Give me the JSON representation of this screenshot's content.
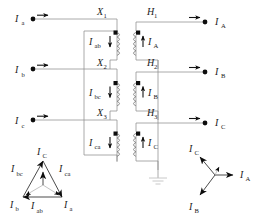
{
  "figure": {
    "type": "electrical-schematic"
  },
  "colors": {
    "wire": "#5a5a5a",
    "wire_light": "#8d8d8d",
    "text": "#1a1a1a",
    "arrow": "#0d0d0d",
    "ground": "#c2c2c2",
    "background": "#ffffff"
  },
  "left_terminals": [
    {
      "base": "I",
      "sub": "a",
      "id": "terminal-ia"
    },
    {
      "base": "I",
      "sub": "b",
      "id": "terminal-ib"
    },
    {
      "base": "I",
      "sub": "c",
      "id": "terminal-ic"
    }
  ],
  "right_terminals": [
    {
      "base": "I",
      "sub": "A",
      "id": "terminal-IA"
    },
    {
      "base": "I",
      "sub": "B",
      "id": "terminal-IB"
    },
    {
      "base": "I",
      "sub": "C",
      "id": "terminal-IC"
    }
  ],
  "delta_windings": [
    {
      "tap": "X",
      "tap_sub": "1",
      "current": "I",
      "current_sub": "ab"
    },
    {
      "tap": "X",
      "tap_sub": "2",
      "current": "I",
      "current_sub": "bc"
    },
    {
      "tap": "X",
      "tap_sub": "3",
      "current": "I",
      "current_sub": "ca"
    }
  ],
  "wye_windings": [
    {
      "tap": "H",
      "tap_sub": "1",
      "current": "I",
      "current_sub": "A"
    },
    {
      "tap": "H",
      "tap_sub": "2",
      "current": "I",
      "current_sub": "B"
    },
    {
      "tap": "H",
      "tap_sub": "3",
      "current": "I",
      "current_sub": "C"
    }
  ],
  "delta_phasor": {
    "name": "delta-current-phasor",
    "vertex_labels": [
      {
        "base": "I",
        "sub": "C",
        "position": "top"
      },
      {
        "base": "I",
        "sub": "b",
        "position": "bottom-left"
      },
      {
        "base": "I",
        "sub": "a",
        "position": "bottom-right"
      }
    ],
    "side_labels": [
      {
        "base": "I",
        "sub": "bc",
        "position": "left"
      },
      {
        "base": "I",
        "sub": "ca",
        "position": "right"
      },
      {
        "base": "I",
        "sub": "ab",
        "position": "bottom"
      }
    ]
  },
  "wye_phasor": {
    "name": "wye-current-phasor",
    "labels": [
      {
        "base": "I",
        "sub": "C",
        "position": "upper-left"
      },
      {
        "base": "I",
        "sub": "A",
        "position": "right"
      },
      {
        "base": "I",
        "sub": "B",
        "position": "lower-left"
      }
    ]
  },
  "ground": {
    "name": "ground-symbol",
    "label": ""
  }
}
